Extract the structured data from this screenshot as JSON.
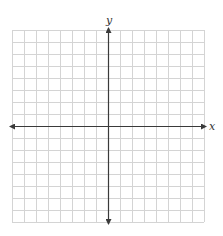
{
  "figure": {
    "type": "coordinate-plane",
    "grid": {
      "columns": 16,
      "rows": 16,
      "cell_px": 12,
      "left": 12,
      "top": 30,
      "line_color": "#d4d4d4"
    },
    "axes": {
      "color": "#3a3a3a",
      "x_label": "x",
      "y_label": "y",
      "origin_px": [
        108,
        126
      ],
      "arrows": "both-ends"
    }
  }
}
